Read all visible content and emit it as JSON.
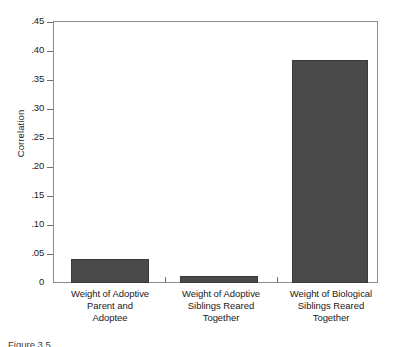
{
  "chart_data": {
    "type": "bar",
    "title": "",
    "xlabel": "",
    "ylabel": "Correlation",
    "ylim": [
      0,
      0.45
    ],
    "grid": false,
    "legend": "none",
    "categories": [
      "Weight of Adoptive Parent and Adoptee",
      "Weight of Adoptive Siblings Reared Together",
      "Weight of Biological Siblings Reared Together"
    ],
    "category_lines": [
      [
        "Weight of Adoptive",
        "Parent and",
        "Adoptee"
      ],
      [
        "Weight of Adoptive",
        "Siblings Reared",
        "Together"
      ],
      [
        "Weight of Biological",
        "Siblings Reared",
        "Together"
      ]
    ],
    "values": [
      0.042,
      0.012,
      0.385
    ],
    "ytick_labels": [
      ".45",
      ".40",
      ".35",
      ".30",
      ".25",
      ".20",
      ".15",
      ".10",
      ".05",
      "0"
    ],
    "ytick_values": [
      0.45,
      0.4,
      0.35,
      0.3,
      0.25,
      0.2,
      0.15,
      0.1,
      0.05,
      0
    ],
    "bar_color": "#4a4a4a",
    "bar_edge_color": "#3a3a3a",
    "axis_color": "#8d8d8d"
  },
  "caption": {
    "text": "Figure 3.5"
  }
}
